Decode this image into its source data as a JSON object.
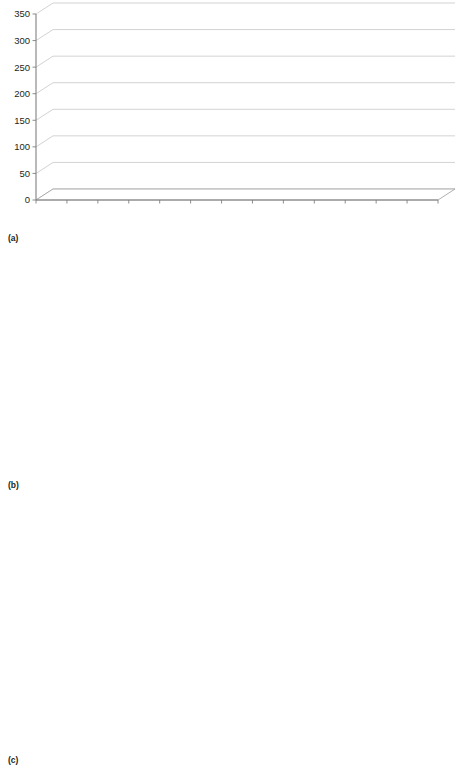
{
  "figure": {
    "panels": [
      {
        "id": "a",
        "label": "(a)"
      },
      {
        "id": "b",
        "label": "(b)"
      },
      {
        "id": "c",
        "label": "(c)"
      }
    ]
  },
  "chart_data": [
    {
      "type": "bar",
      "panel": "(a)",
      "title": "",
      "xlabel": "",
      "ylabel": "",
      "categories": [
        "2000",
        "2001",
        "2002",
        "2003",
        "2004",
        "2005",
        "2006",
        "2007",
        "2008",
        "2009",
        "2010",
        "2011",
        "2012"
      ],
      "values": [
        60,
        103,
        152,
        163,
        209,
        245,
        262,
        262,
        283,
        344,
        351,
        331,
        326
      ],
      "ylim": [
        0,
        350
      ],
      "yticks": [
        0,
        50,
        100,
        150,
        200,
        250,
        300,
        350
      ],
      "grid": true,
      "legend": null,
      "series_color": "#58585a"
    },
    {
      "type": "bar",
      "panel": "(b)",
      "title": "",
      "xlabel": "",
      "ylabel": "",
      "categories": [
        "2000",
        "2001",
        "2002",
        "2003",
        "2004",
        "2005",
        "2006",
        "2007",
        "2008",
        "2009",
        "2010",
        "2011",
        "2012"
      ],
      "series": [
        {
          "name": "MAC",
          "color": "#4d4d4f",
          "values": [
            22,
            36,
            39,
            39,
            58,
            66,
            77,
            79,
            77,
            67,
            96,
            88,
            112
          ]
        },
        {
          "name": "RIC",
          "color": "#b0b0b0",
          "values": [
            39,
            72,
            116,
            127,
            149,
            178,
            187,
            187,
            206,
            279,
            258,
            247,
            219
          ]
        }
      ],
      "ylim": [
        0,
        300
      ],
      "yticks": [
        0,
        50,
        100,
        150,
        200,
        250,
        300
      ],
      "grid": true,
      "legend_position": "top-left"
    },
    {
      "type": "bar",
      "panel": "(c)",
      "title": "",
      "xlabel": "",
      "ylabel": "",
      "categories": [
        "2003",
        "2004",
        "2005",
        "2006",
        "2007",
        "2008",
        "2009",
        "2010",
        "2011",
        "2012"
      ],
      "series": [
        {
          "name": "CBT",
          "color": "#4d4d4f",
          "values": [
            1.0,
            0.3,
            6.2,
            8.2,
            11.3,
            19.4,
            17.3,
            26.2,
            17.3,
            8.2
          ]
        },
        {
          "name": "Haplo-SCT",
          "color": "#b0b0b0",
          "values": [
            0.5,
            0.3,
            0.4,
            1.4,
            8.4,
            14.6,
            16.5,
            26.5,
            41.4,
            51.4
          ]
        }
      ],
      "ylim": [
        0,
        60
      ],
      "yticks": [
        0,
        10,
        20,
        30,
        40,
        50,
        60
      ],
      "grid": true,
      "legend_position": "top-left"
    }
  ]
}
